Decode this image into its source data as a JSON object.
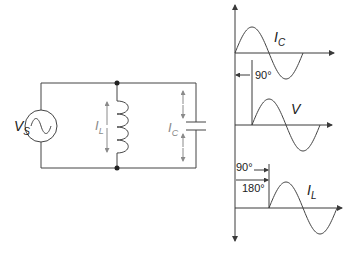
{
  "circuit": {
    "source_label": "V",
    "source_subscript": "S",
    "inductor_current_label": "I",
    "inductor_current_subscript": "L",
    "capacitor_current_label": "I",
    "capacitor_current_subscript": "C"
  },
  "waveforms": {
    "top": {
      "label": "I",
      "subscript": "C",
      "phase_deg": 0
    },
    "middle": {
      "label": "V",
      "subscript": "",
      "phase_deg": 90
    },
    "bottom": {
      "label": "I",
      "subscript": "L",
      "phase_deg": 180
    },
    "annotations": {
      "shift_ic_v": "90°",
      "shift_v_il": "90°",
      "shift_ic_il": "180°"
    }
  },
  "colors": {
    "line": "#3a3a3a",
    "arrow_gray": "#8a8a8a"
  }
}
